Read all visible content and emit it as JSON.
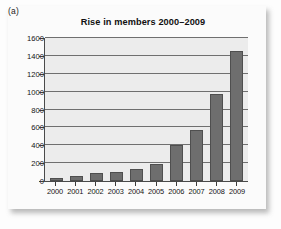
{
  "figure": {
    "panel_label": "(a)",
    "card_background": "#fbfbfb",
    "page_background": "#fdfdfd"
  },
  "chart_data": {
    "type": "bar",
    "title": "Rise in members 2000–2009",
    "xlabel": "",
    "ylabel": "",
    "categories": [
      "2000",
      "2001",
      "2002",
      "2003",
      "2004",
      "2005",
      "2006",
      "2007",
      "2008",
      "2009"
    ],
    "values": [
      35,
      60,
      90,
      105,
      140,
      195,
      400,
      575,
      975,
      1460
    ],
    "series": [
      {
        "name": "Members",
        "values": [
          35,
          60,
          90,
          105,
          140,
          195,
          400,
          575,
          975,
          1460
        ]
      }
    ],
    "ylim": [
      0,
      1600
    ],
    "ytick_values": [
      0,
      200,
      400,
      600,
      800,
      1000,
      1200,
      1400,
      1600
    ],
    "ytick_labels": [
      "0",
      "200",
      "400",
      "600",
      "800",
      "1000",
      "1200",
      "1400",
      "1600"
    ],
    "grid": true,
    "grid_axis": "y",
    "legend": false,
    "legend_position": "none",
    "bar_color": "#6e6e6e",
    "bar_edge_color": "#4f4f4f",
    "plot_background": "#ececec",
    "axis_color": "#4a4a4a",
    "gridline_color": "#6f6f6f",
    "text_color": "#131313"
  }
}
